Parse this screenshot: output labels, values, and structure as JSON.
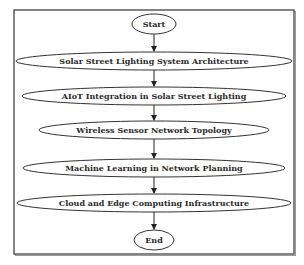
{
  "diagram": {
    "type": "flowchart",
    "direction": "top-to-bottom",
    "frame": {
      "x": 14,
      "y": 10,
      "width": 280,
      "height": 244,
      "stroke": "#333333"
    },
    "colors": {
      "node_fill": "#ffffff",
      "node_stroke": "#333333",
      "edge": "#222222",
      "text": "#2a2a2a"
    },
    "nodes": [
      {
        "id": "start",
        "label": "Start",
        "shape": "ellipse",
        "cx": 154,
        "cy": 24,
        "rx": 22,
        "ry": 10
      },
      {
        "id": "n1",
        "label": "Solar Street Lighting System Architecture",
        "shape": "ellipse",
        "cx": 154,
        "cy": 61,
        "rx": 138,
        "ry": 9
      },
      {
        "id": "n2",
        "label": "AIoT Integration in Solar Street Lighting",
        "shape": "ellipse",
        "cx": 154,
        "cy": 96,
        "rx": 132,
        "ry": 9
      },
      {
        "id": "n3",
        "label": "Wireless Sensor Network Topology",
        "shape": "ellipse",
        "cx": 154,
        "cy": 130,
        "rx": 115,
        "ry": 9
      },
      {
        "id": "n4",
        "label": "Machine Learning in Network Planning",
        "shape": "ellipse",
        "cx": 154,
        "cy": 168,
        "rx": 131,
        "ry": 9
      },
      {
        "id": "n5",
        "label": "Cloud and Edge Computing Infrastructure",
        "shape": "ellipse",
        "cx": 154,
        "cy": 203,
        "rx": 137,
        "ry": 9
      },
      {
        "id": "end",
        "label": "End",
        "shape": "ellipse",
        "cx": 154,
        "cy": 240,
        "rx": 20,
        "ry": 10
      }
    ],
    "edges": [
      {
        "from": "start",
        "to": "n1"
      },
      {
        "from": "n1",
        "to": "n2"
      },
      {
        "from": "n2",
        "to": "n3"
      },
      {
        "from": "n3",
        "to": "n4"
      },
      {
        "from": "n4",
        "to": "n5"
      },
      {
        "from": "n5",
        "to": "end"
      }
    ]
  }
}
